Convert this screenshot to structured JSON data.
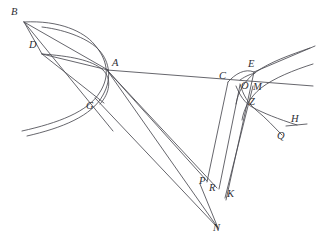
{
  "figure": {
    "width": 316,
    "height": 248,
    "background_color": "#ffffff",
    "stroke_color": "#4a4a52",
    "label_color": "#2e2e33"
  },
  "labels": [
    {
      "id": "B",
      "text": "B",
      "x": 11,
      "y": 7,
      "point_x": 24,
      "point_y": 22
    },
    {
      "id": "D",
      "text": "D",
      "x": 29,
      "y": 40,
      "point_x": 42,
      "point_y": 54
    },
    {
      "id": "A",
      "text": "A",
      "x": 112,
      "y": 58,
      "point_x": 107,
      "point_y": 70
    },
    {
      "id": "G",
      "text": "G",
      "x": 86,
      "y": 101,
      "point_x": 96,
      "point_y": 99
    },
    {
      "id": "E",
      "text": "E",
      "x": 248,
      "y": 59,
      "point_x": 254,
      "point_y": 72
    },
    {
      "id": "C",
      "text": "C",
      "x": 219,
      "y": 71,
      "point_x": 228,
      "point_y": 82
    },
    {
      "id": "O",
      "text": "O",
      "x": 241,
      "y": 81,
      "point_x": 246,
      "point_y": 85
    },
    {
      "id": "M",
      "text": "M",
      "x": 253,
      "y": 82,
      "point_x": 253,
      "point_y": 86
    },
    {
      "id": "Z",
      "text": "Z",
      "x": 249,
      "y": 97,
      "point_x": 250,
      "point_y": 106
    },
    {
      "id": "H",
      "text": "H",
      "x": 291,
      "y": 114,
      "point_x": 297,
      "point_y": 124
    },
    {
      "id": "Q",
      "text": "Q",
      "x": 277,
      "y": 131,
      "point_x": 281,
      "point_y": 137
    },
    {
      "id": "P",
      "text": "P",
      "x": 199,
      "y": 176,
      "point_x": 207,
      "point_y": 181
    },
    {
      "id": "R",
      "text": "R",
      "x": 209,
      "y": 183,
      "point_x": 217,
      "point_y": 188
    },
    {
      "id": "K",
      "text": "K",
      "x": 227,
      "y": 189,
      "point_x": 225,
      "point_y": 191
    },
    {
      "id": "N",
      "text": "N",
      "x": 213,
      "y": 223,
      "point_x": 218,
      "point_y": 225
    }
  ],
  "curves": [
    {
      "name": "hyperbola-outer-left",
      "d": "M 22,131 C 58,123 88,112 100,92 C 110,76 108,60 94,44 C 84,32 60,20 24,22"
    },
    {
      "name": "hyperbola-inner-left",
      "d": "M 27,136 C 62,128 92,116 103,95 C 112,79 110,62 99,50 C 90,40 68,30 42,27"
    },
    {
      "name": "branch-through-A-up",
      "d": "M 42,54 C 70,56 92,60 103,70 C 112,79 110,93 100,104"
    },
    {
      "name": "hyperbola-right-upper",
      "d": "M 310,48 C 290,55 270,62 256,72 C 244,81 238,92 236,104"
    },
    {
      "name": "hyperbola-right-lower",
      "d": "M 313,64 C 294,70 274,78 261,88 C 250,97 244,108 242,120"
    },
    {
      "name": "arc-C-to-E",
      "d": "M 228,82 C 235,74 245,68 254,72"
    },
    {
      "name": "arc-O-small",
      "d": "M 240,80 C 247,75 252,74 255,73"
    },
    {
      "name": "arc-Z-curve",
      "d": "M 236,86 C 240,96 245,103 252,107 C 263,113 278,119 297,125"
    },
    {
      "name": "arc-Q-curve",
      "d": "M 240,84 C 243,95 248,103 256,110 C 266,118 274,127 282,135"
    }
  ],
  "segments": [
    {
      "name": "B-to-A",
      "x1": 24,
      "y1": 22,
      "x2": 108,
      "y2": 70
    },
    {
      "name": "B-to-D",
      "x1": 24,
      "y1": 22,
      "x2": 42,
      "y2": 54
    },
    {
      "name": "B-to-G",
      "x1": 24,
      "y1": 22,
      "x2": 113,
      "y2": 131
    },
    {
      "name": "D-to-A",
      "x1": 42,
      "y1": 54,
      "x2": 108,
      "y2": 70
    },
    {
      "name": "D-ray",
      "x1": 42,
      "y1": 54,
      "x2": 104,
      "y2": 103
    },
    {
      "name": "A-to-C-E",
      "x1": 107,
      "y1": 70,
      "x2": 313,
      "y2": 86
    },
    {
      "name": "A-to-P",
      "x1": 107,
      "y1": 70,
      "x2": 207,
      "y2": 181
    },
    {
      "name": "A-to-R",
      "x1": 107,
      "y1": 70,
      "x2": 217,
      "y2": 188
    },
    {
      "name": "A-to-N",
      "x1": 107,
      "y1": 70,
      "x2": 218,
      "y2": 228
    },
    {
      "name": "G-to-N",
      "x1": 95,
      "y1": 98,
      "x2": 218,
      "y2": 228
    },
    {
      "name": "C-to-P",
      "x1": 228,
      "y1": 82,
      "x2": 207,
      "y2": 182
    },
    {
      "name": "O-to-R",
      "x1": 240,
      "y1": 85,
      "x2": 219,
      "y2": 189
    },
    {
      "name": "M-to-K",
      "x1": 253,
      "y1": 86,
      "x2": 225,
      "y2": 198
    },
    {
      "name": "E-to-K",
      "x1": 254,
      "y1": 72,
      "x2": 226,
      "y2": 200
    },
    {
      "name": "P-to-N",
      "x1": 200,
      "y1": 184,
      "x2": 218,
      "y2": 228
    },
    {
      "name": "tangent-at-E",
      "x1": 254,
      "y1": 72,
      "x2": 315,
      "y2": 46
    },
    {
      "name": "H-baseline",
      "x1": 286,
      "y1": 126,
      "x2": 307,
      "y2": 124
    }
  ]
}
